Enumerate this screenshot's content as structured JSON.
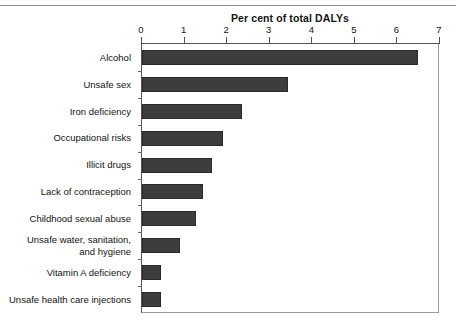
{
  "chart_data": {
    "type": "bar",
    "orientation": "horizontal",
    "title": "Per cent of total DALYs",
    "xlabel": "",
    "ylabel": "",
    "xlim": [
      0,
      7
    ],
    "xticks": [
      0,
      1,
      2,
      3,
      4,
      5,
      6,
      7
    ],
    "xtick_labels": [
      "0",
      "1",
      "2",
      "3",
      "4",
      "5",
      "6",
      "7"
    ],
    "grid": false,
    "legend": null,
    "bar_color": "#3d3d3d",
    "categories": [
      "Alcohol",
      "Unsafe sex",
      "Iron deficiency",
      "Occupational risks",
      "Illicit drugs",
      "Lack of contraception",
      "Childhood sexual abuse",
      "Unsafe water, sanitation,\nand hygiene",
      "Vitamin A deficiency",
      "Unsafe health care injections"
    ],
    "values": [
      6.5,
      3.45,
      2.37,
      1.93,
      1.67,
      1.46,
      1.29,
      0.92,
      0.47,
      0.47
    ]
  }
}
